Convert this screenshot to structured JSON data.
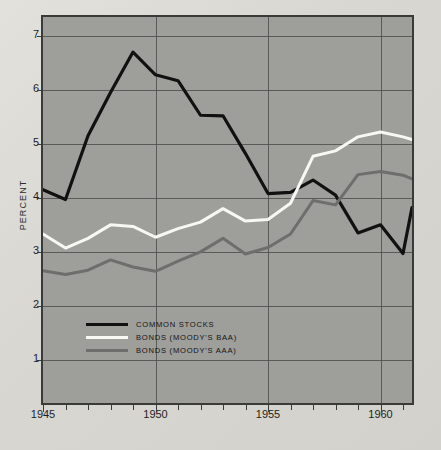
{
  "chart_data": {
    "type": "line",
    "title": "",
    "xlabel": "",
    "ylabel": "PERCENT",
    "xlim": [
      1945,
      1961.4
    ],
    "ylim": [
      0.2,
      7.35
    ],
    "grid": true,
    "legend_position": "inside-bottom-left",
    "y_ticks": [
      7,
      6,
      5,
      4,
      3,
      2,
      1
    ],
    "x_ticks": [
      1945,
      1950,
      1955,
      1960
    ],
    "x_minor_ticks": [
      1946,
      1947,
      1948,
      1949,
      1951,
      1952,
      1953,
      1954,
      1956,
      1957,
      1958,
      1959,
      1961
    ],
    "x": [
      1945,
      1946,
      1947,
      1948,
      1949,
      1950,
      1951,
      1952,
      1953,
      1954,
      1955,
      1956,
      1957,
      1958,
      1959,
      1960,
      1961,
      1961.4
    ],
    "series": [
      {
        "name": "COMMON STOCKS",
        "color": "#111111",
        "values": [
          4.15,
          3.97,
          5.15,
          5.95,
          6.7,
          6.28,
          6.17,
          5.53,
          5.52,
          4.82,
          4.08,
          4.1,
          4.33,
          4.05,
          3.35,
          3.5,
          2.97,
          3.82
        ]
      },
      {
        "name": "BONDS (MOODY'S BAA)",
        "color": "#f7f7f4",
        "values": [
          3.33,
          3.07,
          3.25,
          3.5,
          3.47,
          3.27,
          3.43,
          3.55,
          3.8,
          3.57,
          3.6,
          3.9,
          4.77,
          4.87,
          5.13,
          5.22,
          5.13,
          5.08
        ]
      },
      {
        "name": "BONDS (MOODY'S AAA)",
        "color": "#6e6e6c",
        "values": [
          2.65,
          2.58,
          2.66,
          2.85,
          2.72,
          2.64,
          2.83,
          3.0,
          3.25,
          2.96,
          3.08,
          3.33,
          3.95,
          3.87,
          4.43,
          4.49,
          4.42,
          4.35
        ]
      }
    ]
  },
  "axis": {
    "y_title": "PERCENT",
    "y_tick_labels": [
      "7",
      "6",
      "5",
      "4",
      "3",
      "2",
      "1"
    ],
    "x_tick_labels": [
      "1945",
      "1950",
      "1955",
      "1960"
    ]
  },
  "legend": {
    "items": [
      {
        "label": "COMMON STOCKS",
        "color": "#111111"
      },
      {
        "label": "BONDS (MOODY'S BAA)",
        "color": "#f7f7f4"
      },
      {
        "label": "BONDS (MOODY'S AAA)",
        "color": "#6e6e6c"
      }
    ]
  },
  "colors": {
    "page_background": "#dcdbd6",
    "plot_background": "#9e9e9b",
    "frame": "#3a3a38",
    "grid": "#4e4e4c",
    "text": "#1e1e1e"
  }
}
